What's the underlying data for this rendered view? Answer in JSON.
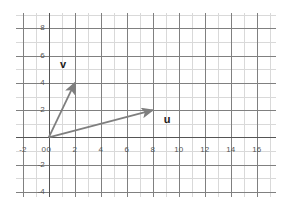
{
  "chart_data": {
    "type": "scatter",
    "title": "",
    "subtitle": "",
    "xlabel": "",
    "ylabel": "",
    "xlim": [
      -2.6,
      17.4
    ],
    "ylim": [
      -4.3,
      9.2
    ],
    "grid": true,
    "grid_major_step": 2,
    "grid_minor_step": 1,
    "legend": "none",
    "annotations": [
      "v",
      "u"
    ],
    "x_ticks": [
      -2,
      0,
      2,
      4,
      6,
      8,
      10,
      12,
      14,
      16
    ],
    "x_tick_labels": [
      "-2",
      "0",
      "2",
      "4",
      "6",
      "8",
      "10",
      "12",
      "14",
      "16"
    ],
    "y_ticks": [
      8,
      6,
      4,
      2,
      0,
      -2,
      -4
    ],
    "y_tick_labels": [
      "8",
      "6",
      "4",
      "2",
      "0",
      "-2",
      "-4"
    ],
    "series": [
      {
        "name": "v",
        "label": "v",
        "kind": "vector",
        "tail": [
          0,
          0
        ],
        "head": [
          2,
          4
        ],
        "components": [
          2,
          4
        ],
        "color": "#7f7f7f",
        "label_position": [
          1.1,
          5.3
        ]
      },
      {
        "name": "u",
        "label": "u",
        "kind": "vector",
        "tail": [
          0,
          0
        ],
        "head": [
          8,
          2
        ],
        "components": [
          8,
          2
        ],
        "color": "#7f7f7f",
        "label_position": [
          9.1,
          1.3
        ]
      }
    ]
  },
  "style": {
    "background": "#ffffff",
    "grid_major_color": "#808080",
    "grid_minor_color": "#d9d9d9",
    "axis_color": "#555555",
    "tick_label_color": "#555555",
    "vector_color": "#7f7f7f",
    "vector_label_color": "#1a1a1a"
  }
}
